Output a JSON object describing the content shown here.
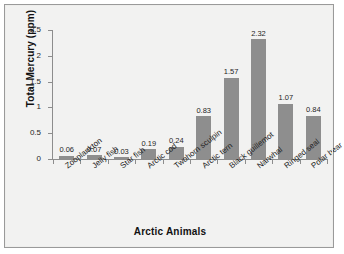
{
  "chart_data": {
    "type": "bar",
    "title": "",
    "xlabel": "Arctic Animals",
    "ylabel": "Total Mercury (ppm)",
    "categories": [
      "Zooplankton",
      "Jelly fish",
      "Star fish",
      "Arctic cod",
      "Twohorn sculpin",
      "Arctic tern",
      "Black guillemot",
      "Narwhal",
      "Ringed seal",
      "Polar bear"
    ],
    "values": [
      0.06,
      0.07,
      0.03,
      0.19,
      0.24,
      0.83,
      1.57,
      2.32,
      1.07,
      0.84
    ],
    "value_labels": [
      "0.06",
      "0.07",
      "0.03",
      "0.19",
      "0.24",
      "0.83",
      "1.57",
      "2.32",
      "1.07",
      "0.84"
    ],
    "ylim": [
      0,
      2.5
    ],
    "ytick_labels": [
      "0",
      "0.5",
      "1",
      "1.5",
      "2",
      "2.5"
    ],
    "ytick_values": [
      0,
      0.5,
      1,
      1.5,
      2,
      2.5
    ],
    "grid": false,
    "legend": false,
    "bar_color": "#8e8e8e",
    "axis_color": "#8d8d8d",
    "background_color": "#f2f2f1",
    "frame_border_color": "#9a9a9a",
    "text_color": "#1f1f1f"
  }
}
